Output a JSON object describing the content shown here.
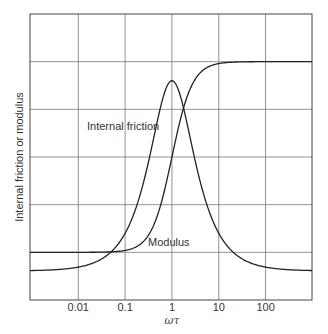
{
  "chart_data": {
    "type": "line",
    "title": "",
    "xlabel": "ωτ",
    "ylabel": "Internal friction or modulus",
    "x_scale": "log",
    "xlim": [
      0.00093,
      980
    ],
    "ylim": [
      0,
      6
    ],
    "grid": true,
    "legend": "none",
    "x_ticks": [
      0.01,
      0.1,
      1,
      10,
      100
    ],
    "x_tick_labels": [
      "0.01",
      "0.1",
      "1",
      "10",
      "100"
    ],
    "y_ticks_unlabeled": [
      1,
      2,
      3,
      4,
      5
    ],
    "series": [
      {
        "name": "Internal friction",
        "x": [
          0.001,
          0.01,
          0.03,
          0.05,
          0.1,
          0.2,
          0.3,
          0.5,
          0.7,
          1,
          1.5,
          2,
          3,
          5,
          10,
          20,
          50,
          100,
          1000
        ],
        "values": [
          0.61,
          0.68,
          0.84,
          1.0,
          1.39,
          2.13,
          2.7,
          3.8,
          4.36,
          4.6,
          4.29,
          3.8,
          2.99,
          2.13,
          1.39,
          1.0,
          0.76,
          0.68,
          0.61
        ]
      },
      {
        "name": "Modulus",
        "x": [
          0.001,
          0.01,
          0.05,
          0.1,
          0.2,
          0.3,
          0.5,
          0.7,
          1,
          1.5,
          2,
          3,
          5,
          10,
          100,
          1000
        ],
        "values": [
          1.0,
          1.0,
          1.01,
          1.04,
          1.15,
          1.33,
          1.8,
          2.34,
          3.0,
          3.77,
          4.2,
          4.6,
          4.85,
          4.96,
          5.0,
          5.0
        ]
      }
    ],
    "annotations": [
      {
        "text": "Internal friction",
        "x": 0.045,
        "y": 3.6
      },
      {
        "text": "Modulus",
        "x": 0.5,
        "y": 1.25
      }
    ]
  },
  "labels": {
    "xlabel": "ωτ",
    "ylabel": "Internal friction or modulus",
    "ann_friction": "Internal friction",
    "ann_modulus": "Modulus",
    "ticks": [
      "0.01",
      "0.1",
      "1",
      "10",
      "100"
    ]
  }
}
